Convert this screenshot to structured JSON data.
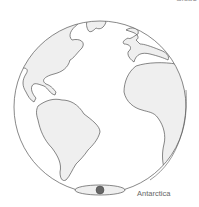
{
  "diagram": {
    "title_fragment": "Globe",
    "colors": {
      "land_fill": "#efefef",
      "outline": "#555555",
      "pole_dot": "#666666",
      "background": "#ffffff"
    },
    "labels": {
      "antarctica": "Antarctica"
    },
    "regions": [
      "North America",
      "Greenland",
      "South America",
      "Europe",
      "Africa",
      "Antarctica"
    ]
  }
}
